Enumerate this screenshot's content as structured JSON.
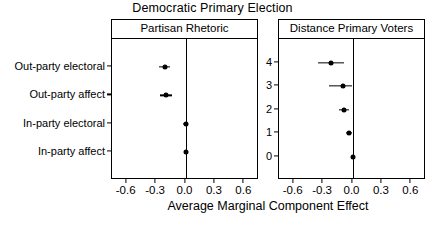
{
  "chart_data": {
    "type": "scatter",
    "title": "Democratic Primary Election",
    "xlabel": "Average Marginal Component Effect",
    "ylabel": "",
    "xlim": [
      -0.75,
      0.75
    ],
    "xticks": [
      -0.6,
      -0.3,
      0.0,
      0.3,
      0.6
    ],
    "xticklabels": [
      "-0.6",
      "-0.3",
      "0.0",
      "0.3",
      "0.6"
    ],
    "grid": false,
    "legend": "none",
    "reference_line_x": 0.0,
    "panels": [
      {
        "label": "Partisan Rhetoric",
        "categories": [
          "Out-party electoral",
          "Out-party affect",
          "In-party electoral",
          "In-party affect"
        ],
        "values": [
          -0.21,
          -0.2,
          0.0,
          0.0
        ],
        "ci_low": [
          -0.27,
          -0.26,
          -0.03,
          -0.01
        ],
        "ci_high": [
          -0.16,
          -0.14,
          0.03,
          0.01
        ]
      },
      {
        "label": "Distance Primary Voters",
        "categories": [
          "4",
          "3",
          "2",
          "1",
          "0"
        ],
        "values": [
          -0.22,
          -0.1,
          -0.09,
          -0.04,
          0.0
        ],
        "ci_low": [
          -0.35,
          -0.24,
          -0.14,
          -0.07,
          0.0
        ],
        "ci_high": [
          -0.09,
          0.0,
          -0.04,
          -0.01,
          0.0
        ]
      }
    ]
  }
}
